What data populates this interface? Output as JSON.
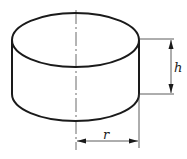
{
  "diagram": {
    "shape": "cylinder",
    "labels": {
      "height": "h",
      "radius": "r"
    },
    "colors": {
      "stroke": "#1a1a1a",
      "background": "#ffffff"
    }
  }
}
